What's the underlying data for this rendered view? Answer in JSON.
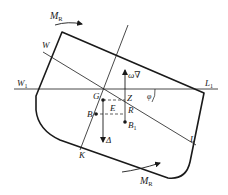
{
  "diagram": {
    "type": "ship heeling stability diagram",
    "labels": {
      "moment_top": "M",
      "moment_top_sub": "R",
      "moment_bottom": "M",
      "moment_bottom_sub": "R",
      "waterline_heeled_start": "W",
      "waterline_heeled_end": "L",
      "waterline_upright_start": "W",
      "waterline_upright_start_sub": "1",
      "waterline_upright_end": "L",
      "waterline_upright_end_sub": "1",
      "center_gravity": "G",
      "center_buoyancy": "B",
      "center_buoyancy_new": "B",
      "center_buoyancy_new_sub": "1",
      "point_e": "E",
      "point_z": "Z",
      "point_r": "R",
      "keel": "K",
      "displacement": "Δ",
      "buoyancy_force": "ω∇",
      "heel_angle": "φ"
    },
    "colors": {
      "stroke": "#1a1a1a",
      "background": "#ffffff"
    }
  }
}
